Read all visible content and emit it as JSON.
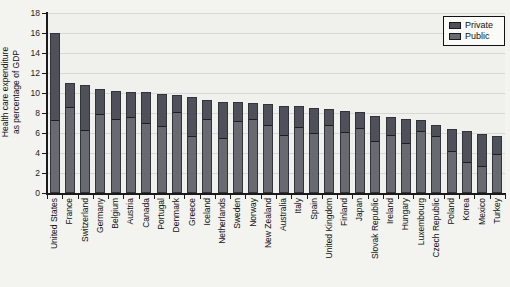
{
  "chart_data": {
    "type": "bar",
    "stacked": true,
    "ylabel_line1": "Health care expenditure",
    "ylabel_line2": "as percentage of GDP",
    "xlabel": "",
    "ylim": [
      0,
      18
    ],
    "ytick_step": 2,
    "ytick_labels": [
      "0",
      "2",
      "4",
      "6",
      "8",
      "10",
      "12",
      "14",
      "16",
      "18"
    ],
    "grid": true,
    "legend_position": "top-right",
    "legend": [
      {
        "name": "Private",
        "color": "#50505a"
      },
      {
        "name": "Public",
        "color": "#696971"
      }
    ],
    "categories": [
      "United States",
      "France",
      "Switzerland",
      "Germany",
      "Belgium",
      "Austria",
      "Canada",
      "Portugal",
      "Denmark",
      "Greece",
      "Iceland",
      "Netherlands",
      "Sweden",
      "Norway",
      "New Zealand",
      "Australia",
      "Italy",
      "Spain",
      "United Kingdom",
      "Finland",
      "Japan",
      "Slovak Republic",
      "Ireland",
      "Hungary",
      "Luxembourg",
      "Czech Republic",
      "Poland",
      "Korea",
      "Mexico",
      "Turkey"
    ],
    "series": [
      {
        "name": "Public",
        "color": "#696971",
        "values": [
          7.4,
          8.7,
          6.4,
          8.0,
          7.5,
          7.7,
          7.1,
          6.8,
          8.2,
          5.8,
          7.5,
          5.6,
          7.3,
          7.5,
          6.9,
          5.9,
          6.7,
          6.1,
          6.9,
          6.2,
          6.6,
          5.3,
          5.9,
          5.1,
          6.3,
          5.8,
          4.3,
          3.2,
          2.8,
          4.0
        ]
      },
      {
        "name": "Private",
        "color": "#50505a",
        "values": [
          8.6,
          2.3,
          4.4,
          2.4,
          2.7,
          2.4,
          3.0,
          3.1,
          1.6,
          3.8,
          1.8,
          3.5,
          1.8,
          1.5,
          2.0,
          2.8,
          2.0,
          2.4,
          1.5,
          2.0,
          1.5,
          2.4,
          1.7,
          2.3,
          1.0,
          1.0,
          2.1,
          3.0,
          3.1,
          1.7
        ]
      }
    ],
    "totals": [
      16.0,
      11.0,
      10.8,
      10.4,
      10.2,
      10.1,
      10.1,
      9.9,
      9.8,
      9.6,
      9.3,
      9.1,
      9.1,
      9.0,
      8.9,
      8.7,
      8.7,
      8.5,
      8.4,
      8.2,
      8.1,
      7.7,
      7.6,
      7.4,
      7.3,
      6.8,
      6.4,
      6.2,
      5.9,
      5.7
    ]
  },
  "colors": {
    "page_background": "#f3f4f0",
    "plot_background": "#f0f1ed",
    "gridline": "#d8d9d4",
    "axis": "#1a1a1a",
    "bar_outline": "#33333a",
    "private": "#50505a",
    "public": "#696971",
    "legend_background": "#fafaf7",
    "legend_border": "#111111"
  },
  "layout_values": {
    "plot_left": 47,
    "plot_top": 13,
    "plot_bottom": 193,
    "plot_right": 505,
    "px_per_unit": 10,
    "bar_width": 10
  }
}
